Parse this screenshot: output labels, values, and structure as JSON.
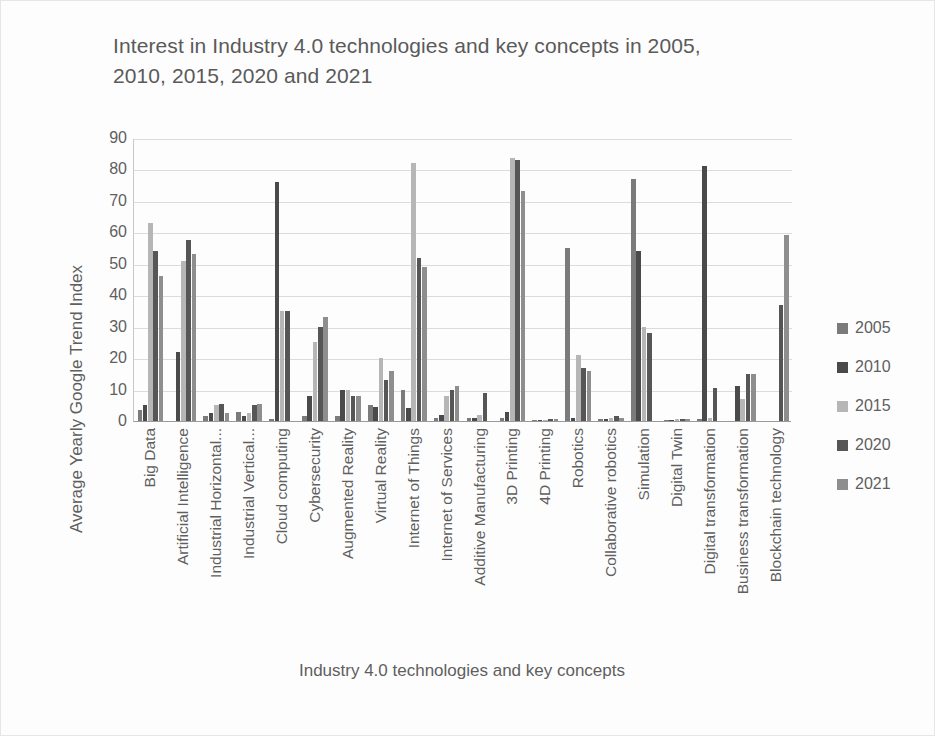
{
  "chart_data": {
    "type": "bar",
    "title": "Interest in Industry 4.0 technologies and key concepts in 2005, 2010, 2015, 2020 and 2021",
    "xlabel": "Industry 4.0 technologies and key concepts",
    "ylabel": "Average Yearly Google Trend Index",
    "ylim": [
      0,
      90
    ],
    "yticks": [
      90,
      80,
      70,
      60,
      50,
      40,
      30,
      20,
      10,
      0
    ],
    "grid": true,
    "legend_position": "right",
    "categories": [
      "Big Data",
      "Artificial Intelligence",
      "Industrial Horizontal...",
      "Industrial Vertical...",
      "Cloud computing",
      "Cybersecurity",
      "Augmented Reality",
      "Virtual Reality",
      "Internet of Things",
      "Internet of Services",
      "Additive Manufacturing",
      "3D Printing",
      "4D Printing",
      "Robotics",
      "Collaborative robotics",
      "Simulation",
      "Digital Twin",
      "Digital transformation",
      "Business transformation",
      "Blockchain technology"
    ],
    "series": [
      {
        "name": "2005",
        "color": "#7b7b7b",
        "values": [
          3.5,
          0,
          1.5,
          3,
          0.5,
          1.5,
          1.5,
          5,
          10,
          1,
          1,
          1,
          0.3,
          55,
          0.5,
          77,
          0.3,
          0.8,
          0,
          0
        ]
      },
      {
        "name": "2010",
        "color": "#4a4a4a",
        "values": [
          5,
          22,
          2.5,
          1.5,
          76,
          8,
          10,
          4.5,
          4,
          2,
          1,
          3,
          0.4,
          1,
          0.8,
          54,
          0.4,
          81,
          11,
          0
        ]
      },
      {
        "name": "2015",
        "color": "#b6b6b6",
        "values": [
          63,
          51,
          5,
          2.5,
          35,
          25,
          10,
          20,
          82,
          8,
          2,
          83.5,
          0.4,
          21,
          1,
          30,
          0.5,
          1,
          7,
          0
        ]
      },
      {
        "name": "2020",
        "color": "#565656",
        "values": [
          54,
          57.5,
          5.5,
          5,
          35,
          30,
          8,
          13,
          52,
          10,
          9,
          83,
          0.5,
          17,
          1.5,
          28,
          0.5,
          10.5,
          15,
          37
        ]
      },
      {
        "name": "2021",
        "color": "#8e8e8e",
        "values": [
          46,
          53,
          2.5,
          5.5,
          0,
          33,
          8,
          16,
          49,
          11,
          0,
          73,
          0.5,
          16,
          1,
          0,
          0.5,
          0,
          15,
          59
        ]
      }
    ]
  },
  "legend": {
    "items": [
      {
        "label": "2005",
        "color": "#7b7b7b"
      },
      {
        "label": "2010",
        "color": "#4a4a4a"
      },
      {
        "label": "2015",
        "color": "#b6b6b6"
      },
      {
        "label": "2020",
        "color": "#565656"
      },
      {
        "label": "2021",
        "color": "#8e8e8e"
      }
    ]
  }
}
